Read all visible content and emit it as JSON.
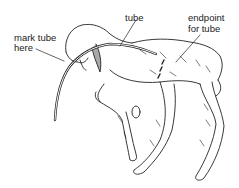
{
  "diagram": {
    "labels": {
      "tube": "tube",
      "mark_line1": "mark tube",
      "mark_line2": "here",
      "endpoint_line1": "endpoint",
      "endpoint_line2": "for tube"
    },
    "colors": {
      "ink": "#222222",
      "background": "#ffffff"
    }
  }
}
